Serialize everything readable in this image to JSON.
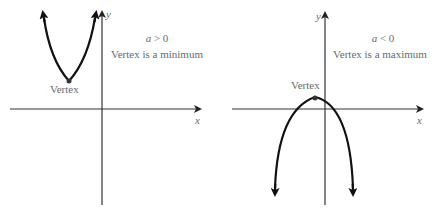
{
  "panels": [
    {
      "id": "left",
      "condition": "a > 0",
      "condition_var": "a",
      "condition_op": " > 0",
      "description": "Vertex is a minimum",
      "vertex_label": "Vertex",
      "x_axis_label": "x",
      "y_axis_label": "y",
      "opens": "up"
    },
    {
      "id": "right",
      "condition": "a < 0",
      "condition_var": "a",
      "condition_op": " < 0",
      "description": "Vertex is a maximum",
      "vertex_label": "Vertex",
      "x_axis_label": "x",
      "y_axis_label": "y",
      "opens": "down"
    }
  ],
  "colors": {
    "curve": "#1a1a1a",
    "axis": "#333333",
    "text": "#6a6a6a"
  }
}
